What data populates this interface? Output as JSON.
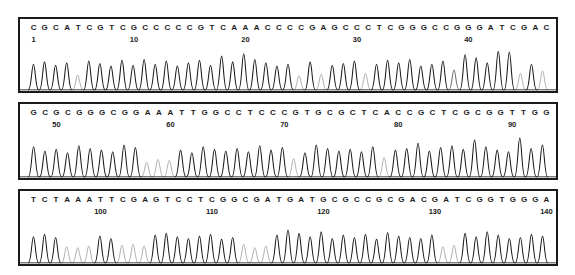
{
  "figure": {
    "type": "electropherogram",
    "panel_count": 3,
    "background_color": "#ffffff",
    "border_color": "#1a1a1a",
    "trace_colors": {
      "strong": "#1a1a1a",
      "weak": "#b4b4b4",
      "mid": "#6f6f6f"
    }
  },
  "panels": [
    {
      "id": "panel-1",
      "name": "chromatogram-panel-1",
      "sequence": "CGCATCGTCGCCCCCGTCAAACCCCGAGCCCTCGGGCCGGGATCGAC",
      "start_position": 1,
      "end_position": 47,
      "ticks": [
        {
          "label": "1",
          "position": 1
        },
        {
          "label": "10",
          "position": 10
        },
        {
          "label": "20",
          "position": 20
        },
        {
          "label": "30",
          "position": 30
        },
        {
          "label": "40",
          "position": 40
        }
      ],
      "peak_intensity": [
        0.62,
        0.68,
        0.6,
        0.66,
        0.36,
        0.7,
        0.64,
        0.58,
        0.72,
        0.6,
        0.74,
        0.62,
        0.7,
        0.58,
        0.66,
        0.72,
        0.6,
        0.82,
        0.68,
        0.88,
        0.74,
        0.66,
        0.58,
        0.62,
        0.34,
        0.68,
        0.38,
        0.6,
        0.64,
        0.7,
        0.4,
        0.62,
        0.72,
        0.66,
        0.74,
        0.58,
        0.62,
        0.7,
        0.48,
        0.86,
        0.78,
        0.66,
        0.94,
        0.92,
        0.4,
        0.62,
        0.46
      ],
      "peak_shade": [
        "s",
        "s",
        "s",
        "s",
        "w",
        "s",
        "s",
        "s",
        "s",
        "s",
        "s",
        "s",
        "s",
        "s",
        "s",
        "s",
        "s",
        "s",
        "s",
        "s",
        "s",
        "s",
        "s",
        "s",
        "w",
        "s",
        "w",
        "s",
        "s",
        "s",
        "w",
        "s",
        "s",
        "s",
        "s",
        "s",
        "s",
        "s",
        "m",
        "s",
        "s",
        "s",
        "s",
        "s",
        "w",
        "s",
        "w"
      ]
    },
    {
      "id": "panel-2",
      "name": "chromatogram-panel-2",
      "sequence": "GCGCGGGCGGAAATTGGCCTCCCGTGCGCTCACCGCTCGCGGTTGG",
      "start_position": 48,
      "end_position": 93,
      "ticks": [
        {
          "label": "50",
          "position": 50
        },
        {
          "label": "60",
          "position": 60
        },
        {
          "label": "70",
          "position": 70
        },
        {
          "label": "80",
          "position": 80
        },
        {
          "label": "90",
          "position": 90
        }
      ],
      "peak_intensity": [
        0.7,
        0.6,
        0.64,
        0.56,
        0.72,
        0.66,
        0.62,
        0.58,
        0.74,
        0.68,
        0.34,
        0.4,
        0.38,
        0.62,
        0.56,
        0.7,
        0.64,
        0.6,
        0.66,
        0.58,
        0.72,
        0.62,
        0.68,
        0.42,
        0.56,
        0.74,
        0.66,
        0.6,
        0.64,
        0.58,
        0.7,
        0.44,
        0.62,
        0.66,
        0.78,
        0.6,
        0.68,
        0.72,
        0.64,
        0.86,
        0.7,
        0.62,
        0.58,
        0.9,
        0.66,
        0.74
      ],
      "peak_shade": [
        "s",
        "s",
        "s",
        "s",
        "s",
        "s",
        "s",
        "s",
        "s",
        "s",
        "w",
        "w",
        "w",
        "s",
        "s",
        "s",
        "s",
        "s",
        "s",
        "s",
        "s",
        "s",
        "s",
        "w",
        "s",
        "s",
        "s",
        "s",
        "s",
        "s",
        "s",
        "w",
        "s",
        "s",
        "s",
        "s",
        "s",
        "s",
        "s",
        "s",
        "s",
        "s",
        "s",
        "s",
        "s",
        "s"
      ]
    },
    {
      "id": "panel-3",
      "name": "chromatogram-panel-3",
      "sequence": "TCTAAATTCGAGTCCTCGGCGATGATGCGCCGCGACGATCGGTGGGA",
      "start_position": 94,
      "end_position": 140,
      "ticks": [
        {
          "label": "100",
          "position": 100
        },
        {
          "label": "110",
          "position": 110
        },
        {
          "label": "120",
          "position": 120
        },
        {
          "label": "130",
          "position": 130
        },
        {
          "label": "140",
          "position": 140
        }
      ],
      "peak_intensity": [
        0.62,
        0.68,
        0.6,
        0.38,
        0.36,
        0.4,
        0.64,
        0.58,
        0.42,
        0.44,
        0.4,
        0.66,
        0.7,
        0.62,
        0.58,
        0.64,
        0.68,
        0.56,
        0.6,
        0.44,
        0.36,
        0.4,
        0.66,
        0.78,
        0.7,
        0.62,
        0.74,
        0.58,
        0.66,
        0.6,
        0.68,
        0.56,
        0.72,
        0.64,
        0.6,
        0.58,
        0.66,
        0.38,
        0.42,
        0.7,
        0.62,
        0.74,
        0.66,
        0.58,
        0.6,
        0.68,
        0.64
      ],
      "peak_shade": [
        "s",
        "s",
        "s",
        "w",
        "w",
        "w",
        "s",
        "s",
        "w",
        "w",
        "w",
        "s",
        "s",
        "s",
        "s",
        "s",
        "s",
        "s",
        "s",
        "w",
        "w",
        "w",
        "s",
        "s",
        "s",
        "s",
        "s",
        "s",
        "s",
        "s",
        "s",
        "s",
        "s",
        "s",
        "s",
        "s",
        "s",
        "w",
        "w",
        "s",
        "s",
        "s",
        "s",
        "s",
        "s",
        "s",
        "s"
      ]
    }
  ]
}
